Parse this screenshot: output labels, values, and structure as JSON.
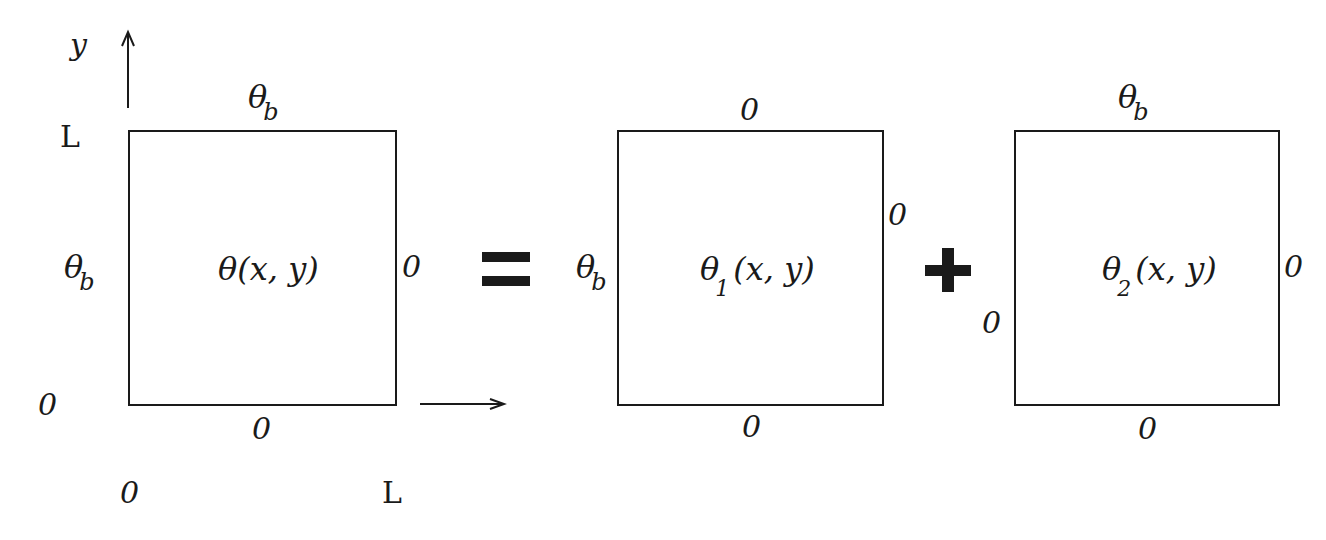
{
  "diagram": {
    "operators": {
      "equals": "=",
      "plus": "+"
    },
    "axes": {
      "y_label": "y",
      "y_top_tick": "L",
      "origin_left_tick": "0",
      "x_origin_tick": "0",
      "x_end_tick": "L"
    },
    "panel_1": {
      "function": "θ",
      "function_sub": "",
      "function_args": "(x, y)",
      "top_bc_symbol": "θ",
      "top_bc_sub": "b",
      "left_bc_symbol": "θ",
      "left_bc_sub": "b",
      "right_bc": "0",
      "bottom_bc": "0"
    },
    "panel_2": {
      "function": "θ",
      "function_sub": "1",
      "function_args": "(x, y)",
      "top_bc": "0",
      "left_bc_symbol": "θ",
      "left_bc_sub": "b",
      "right_bc": "0",
      "bottom_bc": "0"
    },
    "panel_3": {
      "function": "θ",
      "function_sub": "2",
      "function_args": "(x, y)",
      "top_bc_symbol": "θ",
      "top_bc_sub": "b",
      "left_bc": "0",
      "right_bc": "0",
      "bottom_bc": "0"
    }
  }
}
